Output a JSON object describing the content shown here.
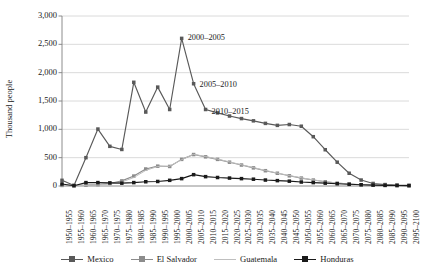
{
  "chart_data": {
    "type": "line",
    "title": "",
    "xlabel": "",
    "ylabel": "Thousand people",
    "ylim": [
      0,
      3000
    ],
    "ytick_labels": [
      "0",
      "500",
      "1,000",
      "1,500",
      "2,000",
      "2,500",
      "3,000"
    ],
    "ytick_values": [
      0,
      500,
      1000,
      1500,
      2000,
      2500,
      3000
    ],
    "grid": "horizontal",
    "legend_position": "bottom",
    "categories": [
      "1950–1955",
      "1955–1960",
      "1960–1965",
      "1965–1970",
      "1970–1975",
      "1975–1980",
      "1980–1985",
      "1985–1990",
      "1990–1995",
      "1995–2000",
      "2000–2005",
      "2005–2010",
      "2010–2015",
      "2015–2020",
      "2020–2025",
      "2025–2030",
      "2030–2035",
      "2035–2040",
      "2040–2045",
      "2045–2050",
      "2050–2055",
      "2055–2060",
      "2060–2065",
      "2065–2070",
      "2070–2075",
      "2075–2080",
      "2080–2085",
      "2085–2090",
      "2090–2095",
      "2095–2100"
    ],
    "series": [
      {
        "name": "Mexico",
        "color": "#595959",
        "marker": "square",
        "values": [
          100,
          10,
          500,
          1005,
          700,
          645,
          1830,
          1305,
          1745,
          1350,
          2605,
          1805,
          1350,
          1290,
          1235,
          1190,
          1150,
          1105,
          1070,
          1085,
          1055,
          870,
          640,
          420,
          225,
          105,
          45,
          25,
          15,
          10
        ]
      },
      {
        "name": "El Salvador",
        "color": "#8c8c8c",
        "marker": "square",
        "values": [
          10,
          10,
          15,
          25,
          45,
          90,
          175,
          300,
          350,
          345,
          470,
          555,
          515,
          470,
          420,
          370,
          320,
          270,
          225,
          180,
          140,
          105,
          75,
          50,
          35,
          22,
          14,
          10,
          8,
          6
        ]
      },
      {
        "name": "Guatemala",
        "color": "#bfbfbf",
        "marker": "none",
        "values": [
          8,
          8,
          12,
          20,
          35,
          70,
          150,
          275,
          345,
          350,
          465,
          560,
          520,
          475,
          425,
          375,
          325,
          275,
          228,
          185,
          145,
          108,
          78,
          52,
          36,
          23,
          15,
          11,
          8,
          6
        ]
      },
      {
        "name": "Honduras",
        "color": "#1a1a1a",
        "marker": "square",
        "values": [
          35,
          5,
          60,
          60,
          55,
          50,
          60,
          75,
          80,
          100,
          130,
          200,
          165,
          150,
          140,
          130,
          120,
          105,
          95,
          85,
          70,
          60,
          50,
          40,
          30,
          22,
          16,
          12,
          9,
          7
        ]
      }
    ],
    "annotations": [
      {
        "text": "2000–2005",
        "category": "2000–2005",
        "value": 2605
      },
      {
        "text": "2005–2010",
        "category": "2005–2010",
        "value": 1805
      },
      {
        "text": "2010–2015",
        "category": "2010–2015",
        "value": 1350
      }
    ]
  }
}
